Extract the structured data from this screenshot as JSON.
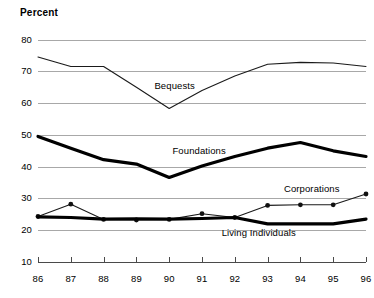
{
  "chart_data": {
    "type": "line",
    "title": "",
    "ylabel": "Percent",
    "xlabel": "",
    "ylim": [
      10,
      80
    ],
    "yticks": [
      10,
      20,
      30,
      40,
      50,
      60,
      70,
      80
    ],
    "grid": true,
    "legend_position": "inline-annotations",
    "x": [
      "86",
      "87",
      "88",
      "89",
      "90",
      "91",
      "92",
      "93",
      "94",
      "95",
      "96"
    ],
    "categories": [
      "86",
      "87",
      "88",
      "89",
      "90",
      "91",
      "92",
      "93",
      "94",
      "95",
      "96"
    ],
    "series": [
      {
        "name": "Bequests",
        "style": "thin",
        "markers": false,
        "values": [
          74.5,
          71.5,
          71.5,
          65.0,
          58.3,
          64.0,
          68.5,
          72.2,
          72.8,
          72.6,
          71.5
        ]
      },
      {
        "name": "Foundations",
        "style": "thick",
        "markers": false,
        "values": [
          49.5,
          45.8,
          42.2,
          40.8,
          36.6,
          40.2,
          43.2,
          45.8,
          47.6,
          45.0,
          43.2
        ]
      },
      {
        "name": "Corporations",
        "style": "thin",
        "markers": true,
        "values": [
          24.3,
          28.2,
          23.4,
          23.2,
          23.4,
          25.2,
          24.0,
          27.8,
          28.0,
          28.0,
          31.4
        ]
      },
      {
        "name": "Living Individuals",
        "style": "thick",
        "markers": false,
        "values": [
          24.2,
          24.0,
          23.5,
          23.6,
          23.5,
          23.7,
          24.0,
          22.0,
          22.0,
          22.0,
          23.5
        ]
      }
    ],
    "annotations": [
      {
        "text": "Bequests",
        "x_pct": 35.5,
        "y_value": 65.5
      },
      {
        "text": "Foundations",
        "x_pct": 41.0,
        "y_value": 44.8
      },
      {
        "text": "Corporations",
        "x_pct": 75.0,
        "y_value": 33.0
      },
      {
        "text": "Living Individuals",
        "x_pct": 56.0,
        "y_value": 19.0
      }
    ]
  }
}
